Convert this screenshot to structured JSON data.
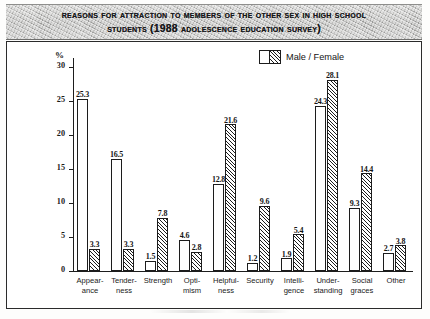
{
  "title": {
    "line1": "Reasons for Attraction to Members of the Other Sex in High School",
    "line2": "Students (1988 Adolescence Education Survey)"
  },
  "legend": {
    "label": "Male / Female",
    "male_name": "Male",
    "female_name": "Female"
  },
  "axis": {
    "unit": "%",
    "ticks": [
      "0",
      "5",
      "10",
      "15",
      "20",
      "25",
      "30"
    ]
  },
  "chart_data": {
    "type": "bar",
    "title": "Reasons for Attraction to Members of the Other Sex in High School Students (1988 Adolescence Education Survey)",
    "xlabel": "",
    "ylabel": "%",
    "ylim": [
      0,
      30
    ],
    "yticks": [
      0,
      5,
      10,
      15,
      20,
      25,
      30
    ],
    "grid": false,
    "legend_position": "top-right",
    "categories": [
      "Appear-ance",
      "Tender-ness",
      "Strength",
      "Opti-mism",
      "Helpful-ness",
      "Security",
      "Intelli-gence",
      "Under-standing",
      "Social graces",
      "Other"
    ],
    "category_lines": [
      [
        "Appear-",
        "ance"
      ],
      [
        "Tender-",
        "ness"
      ],
      [
        "Strength",
        ""
      ],
      [
        "Opti-",
        "mism"
      ],
      [
        "Helpful-",
        "ness"
      ],
      [
        "Security",
        ""
      ],
      [
        "Intelli-",
        "gence"
      ],
      [
        "Under-",
        "standing"
      ],
      [
        "Social",
        "graces"
      ],
      [
        "Other",
        ""
      ]
    ],
    "series": [
      {
        "name": "Male",
        "fill": "white",
        "values": [
          25.3,
          16.5,
          1.5,
          4.6,
          12.8,
          1.2,
          1.9,
          24.3,
          9.3,
          2.7
        ]
      },
      {
        "name": "Female",
        "fill": "hatched",
        "values": [
          3.3,
          3.3,
          7.8,
          2.8,
          21.6,
          9.6,
          5.4,
          28.1,
          14.4,
          3.8
        ]
      }
    ]
  },
  "colors": {
    "ink": "#1c1c1c",
    "banner_gray": "#bcbcba",
    "paper": "#ffffff"
  }
}
